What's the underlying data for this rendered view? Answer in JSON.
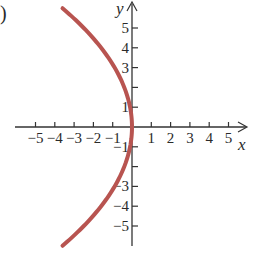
{
  "chart_data": {
    "type": "line",
    "title": "",
    "panel_label": ")",
    "xlabel": "x",
    "ylabel": "y",
    "xlim": [
      -5.5,
      5.8
    ],
    "ylim": [
      -6.2,
      6.4
    ],
    "grid": false,
    "x_ticks": [
      -5,
      -4,
      -3,
      -2,
      -1,
      1,
      2,
      3,
      4,
      5
    ],
    "x_tick_labels": [
      "−5",
      "−4",
      "−3",
      "−2",
      "−1",
      "1",
      "2",
      "3",
      "4",
      "5"
    ],
    "y_ticks": [
      5,
      4,
      3,
      2,
      1,
      -1,
      -2,
      -3,
      -4,
      -5
    ],
    "y_tick_labels": [
      "5",
      "4",
      "3",
      "",
      "1",
      "−1",
      "",
      "−3",
      "−4",
      "−5"
    ],
    "series": [
      {
        "name": "x = -y^2/10",
        "color": "#b85450",
        "equation": "x = -y^2/10",
        "points": [
          {
            "x": -3.6,
            "y": 6.0
          },
          {
            "x": -2.5,
            "y": 5.0
          },
          {
            "x": -1.6,
            "y": 4.0
          },
          {
            "x": -0.9,
            "y": 3.0
          },
          {
            "x": -0.4,
            "y": 2.0
          },
          {
            "x": -0.1,
            "y": 1.0
          },
          {
            "x": 0.0,
            "y": 0.0
          },
          {
            "x": -0.1,
            "y": -1.0
          },
          {
            "x": -0.4,
            "y": -2.0
          },
          {
            "x": -0.9,
            "y": -3.0
          },
          {
            "x": -1.6,
            "y": -4.0
          },
          {
            "x": -2.5,
            "y": -5.0
          },
          {
            "x": -3.6,
            "y": -6.0
          }
        ]
      }
    ],
    "colors": {
      "curve": "#b85450",
      "axes": "#333333"
    }
  }
}
